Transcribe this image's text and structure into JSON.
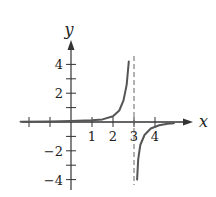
{
  "chart_data": {
    "type": "line",
    "title": "",
    "xlabel": "x",
    "ylabel": "y",
    "xlim": [
      -2.6,
      5.0
    ],
    "ylim": [
      -4.5,
      5.2
    ],
    "x_ticks": [
      -2,
      -1,
      1,
      2,
      3,
      4
    ],
    "x_tick_labels": [
      "1",
      "2",
      "3",
      "4"
    ],
    "x_labeled_ticks": [
      1,
      2,
      3,
      4
    ],
    "y_ticks": [
      -4,
      -3,
      -2,
      -1,
      1,
      2,
      3,
      4
    ],
    "y_tick_labels": [
      "4",
      "2",
      "−2",
      "−4"
    ],
    "y_labeled_ticks": [
      4,
      2,
      -2,
      -4
    ],
    "asymptote": {
      "type": "vertical",
      "x": 3,
      "style": "dashed"
    },
    "grid": false,
    "legend": null,
    "series": [
      {
        "name": "left branch",
        "points": [
          [
            -2.4,
            0.02
          ],
          [
            -1,
            0.04
          ],
          [
            0,
            0.07
          ],
          [
            1,
            0.12
          ],
          [
            1.5,
            0.18
          ],
          [
            2,
            0.4
          ],
          [
            2.3,
            0.8
          ],
          [
            2.5,
            1.5
          ],
          [
            2.65,
            2.6
          ],
          [
            2.75,
            4.2
          ]
        ]
      },
      {
        "name": "right branch",
        "points": [
          [
            3.15,
            -4.0
          ],
          [
            3.2,
            -2.6
          ],
          [
            3.3,
            -1.6
          ],
          [
            3.5,
            -0.9
          ],
          [
            3.8,
            -0.45
          ],
          [
            4.2,
            -0.22
          ],
          [
            4.6,
            -0.12
          ],
          [
            4.9,
            -0.08
          ]
        ]
      }
    ]
  },
  "colors": {
    "curve": "#555555",
    "axis": "#333333"
  }
}
